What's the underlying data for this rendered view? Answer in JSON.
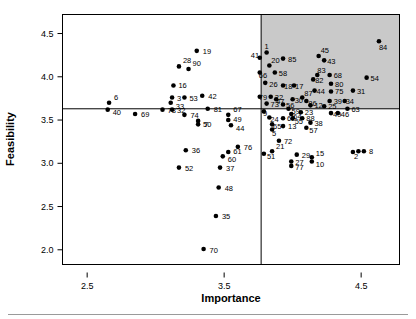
{
  "chart_data": {
    "type": "scatter",
    "title": "",
    "xlabel": "Importance",
    "ylabel": "Feasibility",
    "xlim": [
      2.32,
      4.78
    ],
    "ylim": [
      1.83,
      4.72
    ],
    "xticks": [
      2.5,
      3.5,
      4.5
    ],
    "xticklabels": [
      "2.5",
      "3.5",
      "4.5"
    ],
    "yticks": [
      2.0,
      2.5,
      3.0,
      3.5,
      4.0,
      4.5
    ],
    "yticklabels": [
      "2.0",
      "2.5",
      "3.0",
      "3.5",
      "4.0",
      "4.5"
    ],
    "grid": false,
    "legend": null,
    "reference_lines": {
      "vertical_x": 3.77,
      "horizontal_y": 3.63
    },
    "shaded_quadrant": {
      "x_from": 3.77,
      "x_to": 4.78,
      "y_from": 3.63,
      "y_to": 4.72,
      "color": "#c9c9c9",
      "description": "upper-right quadrant highlight"
    },
    "point_label_field": "id",
    "points": [
      {
        "id": "19",
        "x": 3.3,
        "y": 4.3,
        "label_dx": 6,
        "label_dy": 3
      },
      {
        "id": "6",
        "x": 2.66,
        "y": 3.7,
        "label_dx": 5,
        "label_dy": -3
      },
      {
        "id": "40",
        "x": 2.65,
        "y": 3.62,
        "label_dx": 5,
        "label_dy": 5
      },
      {
        "id": "69",
        "x": 2.85,
        "y": 3.57,
        "label_dx": 6,
        "label_dy": 3
      },
      {
        "id": "42",
        "x": 3.34,
        "y": 3.78,
        "label_dx": 6,
        "label_dy": 3
      },
      {
        "id": "81",
        "x": 3.38,
        "y": 3.63,
        "label_dx": 6,
        "label_dy": 3
      },
      {
        "id": "7",
        "x": 3.31,
        "y": 3.45,
        "label_dx": 6,
        "label_dy": 3
      },
      {
        "id": "67",
        "x": 3.53,
        "y": 3.56,
        "label_dx": 5,
        "label_dy": -3
      },
      {
        "id": "49",
        "x": 3.53,
        "y": 3.5,
        "label_dx": 5,
        "label_dy": 2
      },
      {
        "id": "44",
        "x": 3.55,
        "y": 3.44,
        "label_dx": 5,
        "label_dy": 6
      },
      {
        "id": "36",
        "x": 3.22,
        "y": 3.15,
        "label_dx": 6,
        "label_dy": 3
      },
      {
        "id": "52",
        "x": 3.17,
        "y": 2.95,
        "label_dx": 6,
        "label_dy": 3
      },
      {
        "id": "60",
        "x": 3.49,
        "y": 3.08,
        "label_dx": 5,
        "label_dy": 6
      },
      {
        "id": "61",
        "x": 3.53,
        "y": 3.13,
        "label_dx": 5,
        "label_dy": 2
      },
      {
        "id": "76",
        "x": 3.6,
        "y": 3.19,
        "label_dx": 6,
        "label_dy": 3
      },
      {
        "id": "37",
        "x": 3.47,
        "y": 2.95,
        "label_dx": 6,
        "label_dy": 3
      },
      {
        "id": "48",
        "x": 3.46,
        "y": 2.72,
        "label_dx": 6,
        "label_dy": 3
      },
      {
        "id": "35",
        "x": 3.44,
        "y": 2.39,
        "label_dx": 6,
        "label_dy": 3
      },
      {
        "id": "70",
        "x": 3.35,
        "y": 2.01,
        "label_dx": 6,
        "label_dy": 4
      },
      {
        "id": "3",
        "x": 3.12,
        "y": 3.76,
        "label_dx": 5,
        "label_dy": 3
      },
      {
        "id": "33",
        "x": 3.11,
        "y": 3.7,
        "label_dx": 5,
        "label_dy": 6
      },
      {
        "id": "53",
        "x": 3.21,
        "y": 3.76,
        "label_dx": 5,
        "label_dy": 3
      },
      {
        "id": "16",
        "x": 3.13,
        "y": 3.9,
        "label_dx": 5,
        "label_dy": 3
      },
      {
        "id": "28",
        "x": 3.17,
        "y": 4.12,
        "label_dx": 4,
        "label_dy": -3
      },
      {
        "id": "90",
        "x": 3.24,
        "y": 4.09,
        "label_dx": 4,
        "label_dy": -3
      },
      {
        "id": "78",
        "x": 3.05,
        "y": 3.62,
        "label_dx": 5,
        "label_dy": 3
      },
      {
        "id": "32",
        "x": 3.12,
        "y": 3.62,
        "label_dx": 5,
        "label_dy": 3
      },
      {
        "id": "74",
        "x": 3.21,
        "y": 3.56,
        "label_dx": 6,
        "label_dy": 3
      },
      {
        "id": "50",
        "x": 3.31,
        "y": 3.49,
        "label_dx": 5,
        "label_dy": 6
      },
      {
        "id": "1",
        "x": 3.81,
        "y": 4.28,
        "label_dx": -2,
        "label_dy": -4
      },
      {
        "id": "41",
        "x": 3.76,
        "y": 4.22,
        "label_dx": -9,
        "label_dy": 0
      },
      {
        "id": "85",
        "x": 3.93,
        "y": 4.21,
        "label_dx": 5,
        "label_dy": 3
      },
      {
        "id": "20",
        "x": 3.83,
        "y": 4.13,
        "label_dx": 2,
        "label_dy": -3
      },
      {
        "id": "66",
        "x": 3.76,
        "y": 4.05,
        "label_dx": -1,
        "label_dy": 6
      },
      {
        "id": "58",
        "x": 3.87,
        "y": 4.05,
        "label_dx": 4,
        "label_dy": 4
      },
      {
        "id": "26",
        "x": 3.8,
        "y": 3.93,
        "label_dx": 4,
        "label_dy": 4
      },
      {
        "id": "79",
        "x": 3.76,
        "y": 3.77,
        "label_dx": -1,
        "label_dy": 3
      },
      {
        "id": "22",
        "x": 3.84,
        "y": 3.77,
        "label_dx": 4,
        "label_dy": 3
      },
      {
        "id": "18",
        "x": 3.93,
        "y": 3.9,
        "label_dx": 1,
        "label_dy": 4
      },
      {
        "id": "17",
        "x": 4.01,
        "y": 3.9,
        "label_dx": 1,
        "label_dy": 4
      },
      {
        "id": "47",
        "x": 3.88,
        "y": 3.74,
        "label_dx": 0,
        "label_dy": 5
      },
      {
        "id": "30",
        "x": 4.0,
        "y": 3.74,
        "label_dx": 2,
        "label_dy": 4
      },
      {
        "id": "87",
        "x": 4.07,
        "y": 3.76,
        "label_dx": 2,
        "label_dy": -2
      },
      {
        "id": "86",
        "x": 4.1,
        "y": 3.72,
        "label_dx": 2,
        "label_dy": 5
      },
      {
        "id": "73",
        "x": 3.81,
        "y": 3.69,
        "label_dx": 4,
        "label_dy": 3
      },
      {
        "id": "56",
        "x": 3.93,
        "y": 3.68,
        "label_dx": 3,
        "label_dy": 4
      },
      {
        "id": "59",
        "x": 3.97,
        "y": 3.63,
        "label_dx": 3,
        "label_dy": 5
      },
      {
        "id": "12",
        "x": 4.13,
        "y": 3.67,
        "label_dx": 4,
        "label_dy": 3
      },
      {
        "id": "9",
        "x": 3.79,
        "y": 3.6,
        "label_dx": -1,
        "label_dy": 5
      },
      {
        "id": "24",
        "x": 3.83,
        "y": 3.53,
        "label_dx": 1,
        "label_dy": 5
      },
      {
        "id": "62",
        "x": 3.93,
        "y": 3.52,
        "label_dx": 4,
        "label_dy": 3
      },
      {
        "id": "64",
        "x": 3.99,
        "y": 3.57,
        "label_dx": 2,
        "label_dy": 5
      },
      {
        "id": "55",
        "x": 4.0,
        "y": 3.52,
        "label_dx": 2,
        "label_dy": 6
      },
      {
        "id": "23",
        "x": 4.06,
        "y": 3.59,
        "label_dx": 4,
        "label_dy": 3
      },
      {
        "id": "88",
        "x": 4.07,
        "y": 3.52,
        "label_dx": 4,
        "label_dy": 3
      },
      {
        "id": "65",
        "x": 3.85,
        "y": 3.45,
        "label_dx": 1,
        "label_dy": 5
      },
      {
        "id": "13",
        "x": 3.93,
        "y": 3.43,
        "label_dx": 5,
        "label_dy": 3
      },
      {
        "id": "5",
        "x": 3.85,
        "y": 3.39,
        "label_dx": 0,
        "label_dy": 6
      },
      {
        "id": "72",
        "x": 3.9,
        "y": 3.26,
        "label_dx": 5,
        "label_dy": 3
      },
      {
        "id": "21",
        "x": 3.85,
        "y": 3.14,
        "label_dx": 4,
        "label_dy": -2
      },
      {
        "id": "51",
        "x": 3.79,
        "y": 3.11,
        "label_dx": 3,
        "label_dy": 5
      },
      {
        "id": "29",
        "x": 4.03,
        "y": 3.1,
        "label_dx": 5,
        "label_dy": 3
      },
      {
        "id": "15",
        "x": 4.14,
        "y": 3.07,
        "label_dx": 4,
        "label_dy": -1
      },
      {
        "id": "10",
        "x": 4.14,
        "y": 3.02,
        "label_dx": 4,
        "label_dy": 5
      },
      {
        "id": "27",
        "x": 3.99,
        "y": 3.02,
        "label_dx": 4,
        "label_dy": 3
      },
      {
        "id": "77",
        "x": 3.99,
        "y": 2.97,
        "label_dx": 4,
        "label_dy": 4
      },
      {
        "id": "45",
        "x": 4.19,
        "y": 4.24,
        "label_dx": 2,
        "label_dy": -3
      },
      {
        "id": "43",
        "x": 4.23,
        "y": 4.19,
        "label_dx": 3,
        "label_dy": 4
      },
      {
        "id": "84",
        "x": 4.63,
        "y": 4.41,
        "label_dx": 0,
        "label_dy": 9
      },
      {
        "id": "83",
        "x": 4.18,
        "y": 4.02,
        "label_dx": 0,
        "label_dy": -2
      },
      {
        "id": "68",
        "x": 4.27,
        "y": 4.02,
        "label_dx": 4,
        "label_dy": 3
      },
      {
        "id": "82",
        "x": 4.15,
        "y": 3.97,
        "label_dx": 2,
        "label_dy": 4
      },
      {
        "id": "54",
        "x": 4.54,
        "y": 3.99,
        "label_dx": 4,
        "label_dy": 3
      },
      {
        "id": "80",
        "x": 4.28,
        "y": 3.92,
        "label_dx": 4,
        "label_dy": 3
      },
      {
        "id": "75",
        "x": 4.28,
        "y": 3.83,
        "label_dx": 4,
        "label_dy": 3
      },
      {
        "id": "44b",
        "x": 4.16,
        "y": 3.84,
        "label_dx": 2,
        "label_dy": 3
      },
      {
        "id": "31",
        "x": 4.44,
        "y": 3.84,
        "label_dx": 4,
        "label_dy": 3
      },
      {
        "id": "39",
        "x": 4.27,
        "y": 3.72,
        "label_dx": 4,
        "label_dy": 3
      },
      {
        "id": "34",
        "x": 4.38,
        "y": 3.72,
        "label_dx": 1,
        "label_dy": 3
      },
      {
        "id": "25",
        "x": 4.23,
        "y": 3.66,
        "label_dx": 4,
        "label_dy": 3
      },
      {
        "id": "63",
        "x": 4.4,
        "y": 3.63,
        "label_dx": 4,
        "label_dy": 3
      },
      {
        "id": "49b",
        "x": 4.28,
        "y": 3.58,
        "label_dx": 2,
        "label_dy": 4
      },
      {
        "id": "46",
        "x": 4.33,
        "y": 3.58,
        "label_dx": 3,
        "label_dy": 4
      },
      {
        "id": "38",
        "x": 4.13,
        "y": 3.47,
        "label_dx": 4,
        "label_dy": 3
      },
      {
        "id": "57",
        "x": 4.1,
        "y": 3.41,
        "label_dx": 3,
        "label_dy": 5
      },
      {
        "id": "8",
        "x": 4.52,
        "y": 3.14,
        "label_dx": 5,
        "label_dy": 3
      },
      {
        "id": "2",
        "x": 4.44,
        "y": 3.13,
        "label_dx": 1,
        "label_dy": 7
      },
      {
        "id": "11",
        "x": 4.48,
        "y": 3.14,
        "label_dx": 0,
        "label_dy": -3
      }
    ]
  },
  "point_label_overrides": {
    "44b": "44",
    "49b": "49",
    "11": ""
  }
}
